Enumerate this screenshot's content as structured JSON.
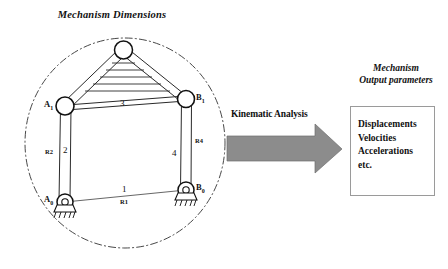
{
  "figure": {
    "left_heading": "Mechanism Dimensions",
    "right_heading_line1": "Mechanism",
    "right_heading_line2": "Output parameters",
    "process_label": "Kinematic Analysis"
  },
  "mechanism": {
    "joints": [
      {
        "id": "A0",
        "label": "A",
        "subscript": "0",
        "type": "fixed-pivot"
      },
      {
        "id": "B0",
        "label": "B",
        "subscript": "0",
        "type": "fixed-pivot"
      },
      {
        "id": "A1",
        "label": "A",
        "subscript": "1",
        "type": "revolute"
      },
      {
        "id": "B1",
        "label": "B",
        "subscript": "1",
        "type": "revolute"
      },
      {
        "id": "C",
        "label": "",
        "subscript": "",
        "type": "coupler-apex"
      }
    ],
    "links": [
      {
        "number": "1",
        "dimension": "R1",
        "name": "ground-link"
      },
      {
        "number": "2",
        "dimension": "R2",
        "name": "input-crank"
      },
      {
        "number": "3",
        "dimension": "",
        "name": "coupler-link"
      },
      {
        "number": "4",
        "dimension": "R4",
        "name": "output-link"
      }
    ]
  },
  "output_box": {
    "items": [
      "Displacements",
      "Velocities",
      "Accelerations",
      "etc."
    ]
  },
  "colors": {
    "arrow_fill": "#8c8c8c",
    "arrow_stroke": "#6e6e6e",
    "line": "#2a2a2a",
    "box_border": "#9a9a9a",
    "background": "#ffffff"
  }
}
